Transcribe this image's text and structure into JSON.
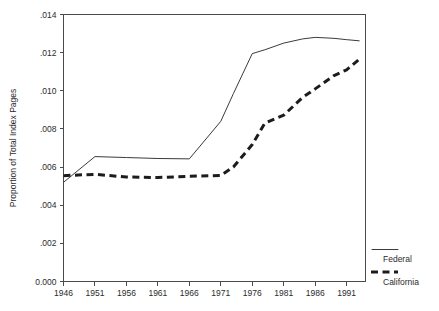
{
  "chart_data": {
    "type": "line",
    "title": "",
    "xlabel": "",
    "ylabel": "Proportion of Total Index Pages",
    "xlim": [
      1946,
      1994
    ],
    "ylim": [
      0.0,
      0.014
    ],
    "grid": false,
    "legend_position": "right-outside-bottom",
    "x_tick_labels": [
      "1946",
      "1951",
      "1956",
      "1961",
      "1966",
      "1971",
      "1976",
      "1981",
      "1986",
      "1991"
    ],
    "x_ticks": [
      1946,
      1951,
      1956,
      1961,
      1966,
      1971,
      1976,
      1981,
      1986,
      1991
    ],
    "y_tick_labels": [
      "0.000",
      ".002",
      ".004",
      ".006",
      ".008",
      ".010",
      ".012",
      ".014"
    ],
    "y_ticks": [
      0.0,
      0.002,
      0.004,
      0.006,
      0.008,
      0.01,
      0.012,
      0.014
    ],
    "x": [
      1946,
      1951,
      1956,
      1961,
      1966,
      1971,
      1973,
      1976,
      1978,
      1981,
      1984,
      1986,
      1989,
      1991,
      1993
    ],
    "series": [
      {
        "name": "Federal",
        "style": "solid-thin",
        "color": "#3a3a3a",
        "values": [
          0.0052,
          0.00655,
          0.0065,
          0.00645,
          0.00643,
          0.0084,
          0.00985,
          0.01195,
          0.01215,
          0.0125,
          0.01272,
          0.0128,
          0.01275,
          0.01268,
          0.01262
        ]
      },
      {
        "name": "California",
        "style": "dashed-thick",
        "color": "#1c1c1c",
        "values": [
          0.00555,
          0.00562,
          0.00548,
          0.00545,
          0.00552,
          0.00556,
          0.006,
          0.00718,
          0.0083,
          0.00872,
          0.00965,
          0.0101,
          0.0108,
          0.0111,
          0.01165
        ]
      }
    ]
  },
  "legend": {
    "entries": [
      {
        "label": "Federal"
      },
      {
        "label": "California"
      }
    ]
  },
  "axes": {
    "y_title": "Proportion of Total Index Pages"
  }
}
